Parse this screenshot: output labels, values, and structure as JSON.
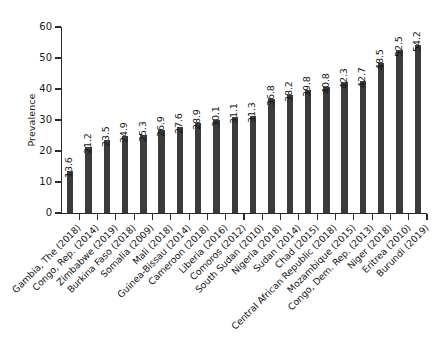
{
  "chart_data": {
    "type": "bar",
    "title": "",
    "xlabel": "",
    "ylabel": "Prevalence",
    "ylim": [
      0,
      60
    ],
    "yticks": [
      0,
      10,
      20,
      30,
      40,
      50,
      60
    ],
    "grid": false,
    "legend": null,
    "orientation": "vertical",
    "bar_color": "#3b3b3b",
    "value_labels": true,
    "categories": [
      "Gambia, The (2018)",
      "Congo, Rep. (2014)",
      "Zimbabwe (2019)",
      "Burkina Faso (2018)",
      "Somalia (2009)",
      "Mali (2018)",
      "Guinea-Bissau (2014)",
      "Cameroon (2018)",
      "Liberia (2016)",
      "Comoros (2012)",
      "South Sudan (2010)",
      "Nigeria (2018)",
      "Sudan (2014)",
      "Chad (2015)",
      "Central African Republic (2018)",
      "Mozambique (2015)",
      "Congo, Dem. Rep. (2013)",
      "Niger (2018)",
      "Eritrea (2010)",
      "Burundi (2019)"
    ],
    "values": [
      13.6,
      21.2,
      23.5,
      24.9,
      25.3,
      26.9,
      27.6,
      28.9,
      30.1,
      31.1,
      31.3,
      36.8,
      38.2,
      39.8,
      40.8,
      42.3,
      42.7,
      48.5,
      52.5,
      54.2
    ]
  }
}
